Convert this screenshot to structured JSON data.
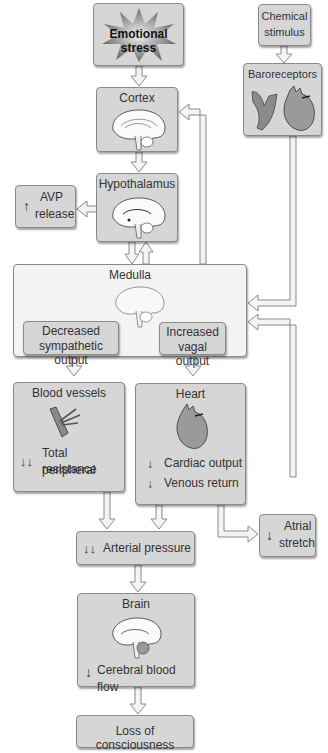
{
  "diagram": {
    "nodes": {
      "emotional_stress": {
        "label": "Emotional stress"
      },
      "chemical_stimulus": {
        "line1": "Chemical",
        "line2": "stimulus"
      },
      "baroreceptors": {
        "label": "Baroreceptors"
      },
      "cortex": {
        "label": "Cortex"
      },
      "hypothalamus": {
        "label": "Hypothalamus"
      },
      "avp_release": {
        "arrow": "↑",
        "line1": "AVP",
        "line2": "release"
      },
      "medulla": {
        "label": "Medulla"
      },
      "decreased_sympathetic": {
        "line1": "Decreased",
        "line2": "sympathetic output"
      },
      "increased_vagal": {
        "line1": "Increased",
        "line2": "vagal output"
      },
      "blood_vessels": {
        "label": "Blood vessels",
        "arrow": "↓↓",
        "line1": "Total peripheral",
        "line2": "resistance"
      },
      "heart": {
        "label": "Heart",
        "arrow1": "↓",
        "item1": "Cardiac output",
        "arrow2": "↓",
        "item2": "Venous return"
      },
      "atrial_stretch": {
        "arrow": "↓",
        "line1": "Atrial",
        "line2": "stretch"
      },
      "arterial_pressure": {
        "arrow": "↓↓",
        "label": "Arterial pressure"
      },
      "brain": {
        "label": "Brain",
        "arrow": "↓",
        "item": "Cerebral blood flow"
      },
      "loss_of_consciousness": {
        "label": "Loss of consciousness"
      }
    },
    "edges": [
      {
        "from": "Emotional stress",
        "to": "Cortex"
      },
      {
        "from": "Cortex",
        "to": "Hypothalamus"
      },
      {
        "from": "Hypothalamus",
        "to": "AVP release"
      },
      {
        "from": "Hypothalamus",
        "to": "Medulla"
      },
      {
        "from": "Medulla",
        "to": "Hypothalamus"
      },
      {
        "from": "Medulla",
        "to": "Cortex"
      },
      {
        "from": "Chemical stimulus",
        "to": "Baroreceptors"
      },
      {
        "from": "Baroreceptors",
        "to": "Medulla"
      },
      {
        "from": "Decreased sympathetic output",
        "to": "Blood vessels"
      },
      {
        "from": "Increased vagal output",
        "to": "Heart"
      },
      {
        "from": "Blood vessels",
        "to": "Arterial pressure"
      },
      {
        "from": "Heart",
        "to": "Arterial pressure"
      },
      {
        "from": "Heart",
        "to": "Atrial stretch"
      },
      {
        "from": "Atrial stretch",
        "to": "Medulla"
      },
      {
        "from": "Arterial pressure",
        "to": "Brain"
      },
      {
        "from": "Brain",
        "to": "Loss of consciousness"
      }
    ],
    "colors": {
      "box_fill": "#d6d6d6",
      "medulla_fill": "#f3f3f3",
      "border": "#8a8a8a",
      "arrow_fill": "#f4f4f4"
    }
  }
}
